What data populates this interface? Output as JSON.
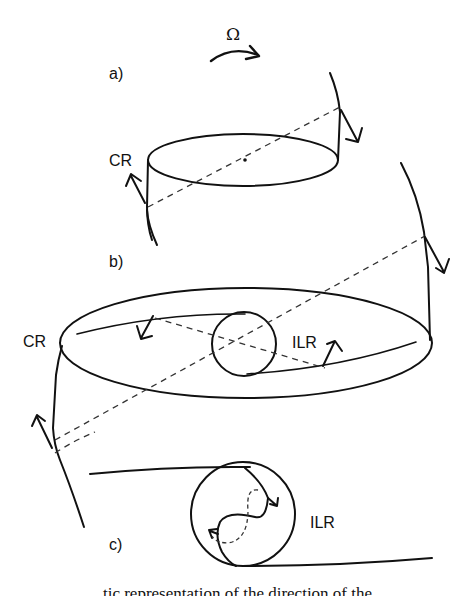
{
  "figure": {
    "rotation_symbol": "Ω",
    "panels": [
      {
        "id": "a",
        "label": "a)",
        "resonance_labels": [
          "CR"
        ]
      },
      {
        "id": "b",
        "label": "b)",
        "resonance_labels": [
          "CR",
          "ILR"
        ]
      },
      {
        "id": "c",
        "label": "c)",
        "resonance_labels": [
          "ILR"
        ]
      }
    ],
    "labels": {
      "panel_a": "a)",
      "panel_b": "b)",
      "panel_c": "c)",
      "cr_a": "CR",
      "cr_b": "CR",
      "ilr_b": "ILR",
      "ilr_c": "ILR",
      "omega": "Ω"
    },
    "icons": {
      "rotation_arrow": "curved-arrow-right",
      "velocity_arrows": "arrow"
    }
  },
  "caption": {
    "partial_text": "tic representation of the direction of the"
  }
}
